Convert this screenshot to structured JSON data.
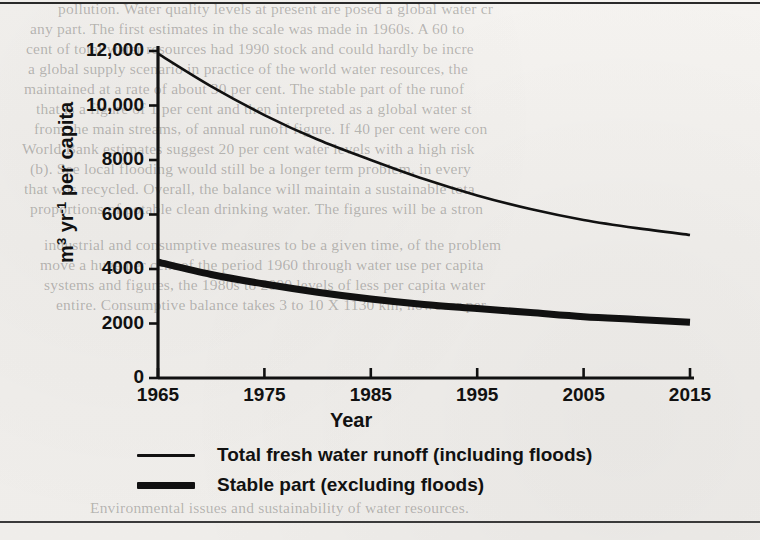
{
  "figure": {
    "background_color": "#f1efec",
    "ink_color": "#111111",
    "rules": {
      "top": true,
      "bottom": true
    }
  },
  "axes": {
    "x_title": "Year",
    "y_title_main": "m",
    "y_title_sup1": "3",
    "y_title_mid": " yr",
    "y_title_sup2": "-1",
    "y_title_tail": " per capita",
    "y_tick_labels": [
      "12,000",
      "10,000",
      "8000",
      "6000",
      "4000",
      "2000",
      "0"
    ],
    "x_tick_labels": [
      "1965",
      "1975",
      "1985",
      "1995",
      "2005",
      "2015"
    ]
  },
  "legend": {
    "items": [
      {
        "label": "Total fresh water runoff (including floods)",
        "style": "thin"
      },
      {
        "label": "Stable part (excluding floods)",
        "style": "thick"
      }
    ]
  },
  "bleed_text": {
    "lines": [
      {
        "text": "pollution. Water quality levels at present are posed a global water cr",
        "x": 58,
        "y": 0
      },
      {
        "text": "any part. The first estimates in the scale was made in 1960s. A 60 to",
        "x": 30,
        "y": 20
      },
      {
        "text": "cent of total water resources had 1990 stock and could hardly be incre",
        "x": 26,
        "y": 40
      },
      {
        "text": "a global supply scenario in practice of the world water resources, the",
        "x": 28,
        "y": 60
      },
      {
        "text": "maintained at a rate of about 30 per cent. The stable part of the runof",
        "x": 24,
        "y": 80
      },
      {
        "text": "that is a figure of 1 per cent and then interpreted as a global water st",
        "x": 36,
        "y": 100
      },
      {
        "text": "from the main streams, of annual runoff figure. If 40 per cent were con",
        "x": 34,
        "y": 120
      },
      {
        "text": "World Bank estimates suggest 20 per cent water levels with a high risk",
        "x": 22,
        "y": 140
      },
      {
        "text": "(b). See local flooding would still be a longer term problem, in every",
        "x": 30,
        "y": 160
      },
      {
        "text": "that was recycled. Overall, the balance will maintain a sustainable tota",
        "x": 24,
        "y": 180
      },
      {
        "text": "proportions of potable clean drinking water. The figures will be a stron",
        "x": 30,
        "y": 200
      },
      {
        "text": "industrial and consumptive measures to be a given time, of the problem",
        "x": 44,
        "y": 236
      },
      {
        "text": "move a huge per cent of the period 1960 through water use per capita",
        "x": 40,
        "y": 256
      },
      {
        "text": "systems and figures, the 1980s to 2000 levels of less per capita water",
        "x": 44,
        "y": 276
      },
      {
        "text": "entire. Consumptive balance takes 3 to 10 X 1130 km, however per",
        "x": 56,
        "y": 296
      }
    ],
    "footer": {
      "text": "Environmental issues and sustainability of water resources.",
      "x": 90,
      "y": 499
    }
  },
  "chart_data": {
    "type": "line",
    "title": "",
    "xlabel": "Year",
    "ylabel": "m3 yr-1 per capita",
    "xlim": [
      1965,
      2015
    ],
    "ylim": [
      0,
      12500
    ],
    "grid": false,
    "legend_position": "below-axes",
    "x": [
      1965,
      1970,
      1975,
      1980,
      1985,
      1990,
      1995,
      2000,
      2005,
      2010,
      2015
    ],
    "series": [
      {
        "name": "Total fresh water runoff (including floods)",
        "style": "thin",
        "values": [
          11900,
          10700,
          9650,
          8750,
          8000,
          7300,
          6700,
          6200,
          5800,
          5500,
          5250
        ]
      },
      {
        "name": "Stable part (excluding floods)",
        "style": "thick",
        "values": [
          4250,
          3800,
          3450,
          3150,
          2900,
          2700,
          2550,
          2400,
          2250,
          2150,
          2050
        ]
      }
    ]
  }
}
